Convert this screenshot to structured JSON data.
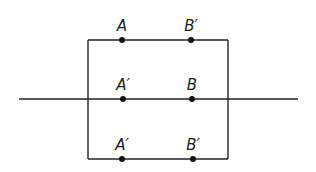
{
  "diagram": {
    "colors": {
      "line": "#222222",
      "dot": "#111111",
      "background": "#ffffff"
    },
    "rectangle": {
      "x1": 88,
      "y1": 40,
      "x2": 228,
      "y2": 159
    },
    "axis_line": {
      "x1": 19,
      "x2": 298,
      "y": 99
    },
    "rows": [
      {
        "y": 40,
        "points": [
          {
            "x": 122,
            "label": "A"
          },
          {
            "x": 191,
            "label": "B′"
          }
        ]
      },
      {
        "y": 99,
        "points": [
          {
            "x": 123,
            "label": "A′"
          },
          {
            "x": 192,
            "label": "B"
          }
        ]
      },
      {
        "y": 159,
        "points": [
          {
            "x": 122,
            "label": "A′"
          },
          {
            "x": 193,
            "label": "B′"
          }
        ]
      }
    ]
  }
}
